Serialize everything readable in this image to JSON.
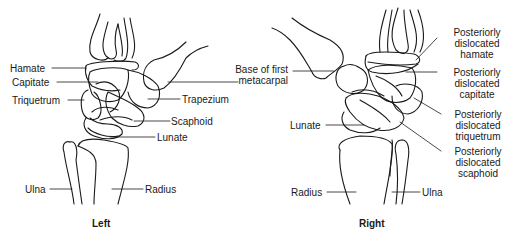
{
  "figure": {
    "left": {
      "caption": "Left",
      "labels": {
        "hamate": "Hamate",
        "capitate": "Capitate",
        "triquetrum": "Triquetrum",
        "base_first_metacarpal_line1": "Base of first",
        "base_first_metacarpal_line2": "metacarpal",
        "trapezium": "Trapezium",
        "scaphoid": "Scaphoid",
        "lunate": "Lunate",
        "ulna": "Ulna",
        "radius": "Radius"
      }
    },
    "right": {
      "caption": "Right",
      "labels": {
        "hamate": [
          "Posteriorly",
          "dislocated",
          "hamate"
        ],
        "capitate": [
          "Posteriorly",
          "dislocated",
          "capitate"
        ],
        "triquetrum": [
          "Posteriorly",
          "dislocated",
          "triquetrum"
        ],
        "scaphoid": [
          "Posteriorly",
          "dislocated",
          "scaphoid"
        ],
        "lunate": "Lunate",
        "radius": "Radius",
        "ulna": "Ulna"
      }
    },
    "line_color": "#1a1a1a"
  }
}
